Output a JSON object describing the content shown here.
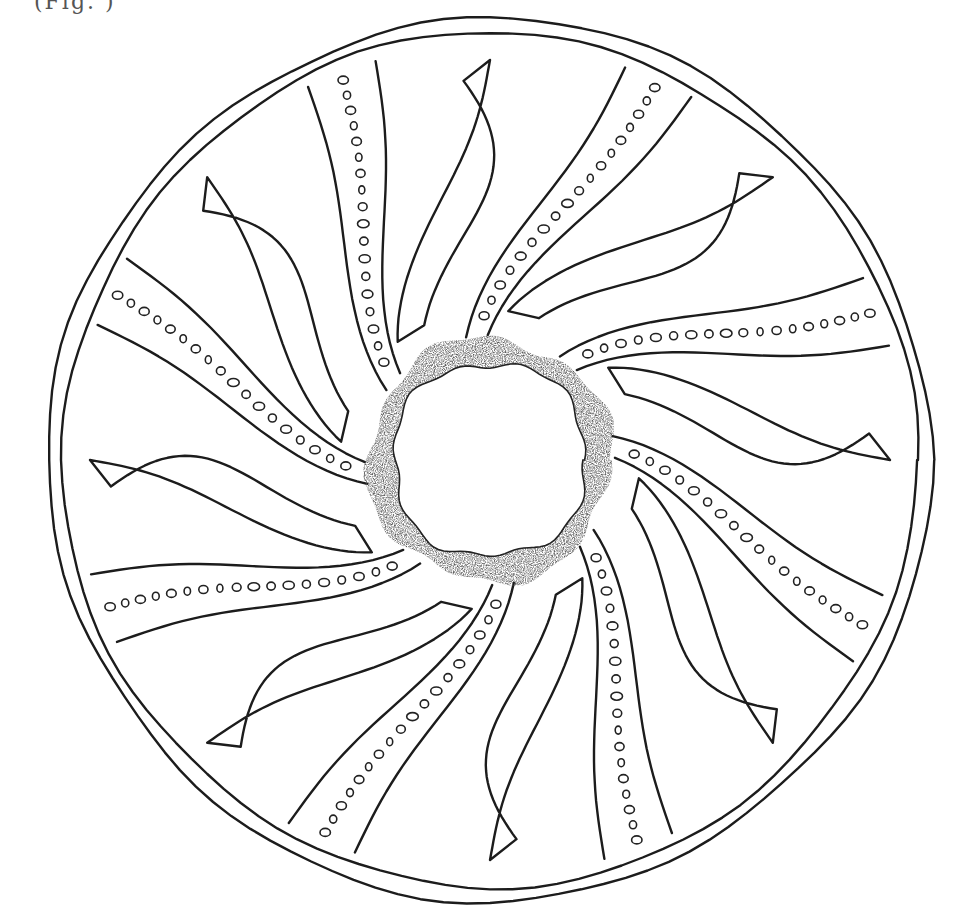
{
  "figure": {
    "caption_fragment": "(Fig. )",
    "ink_color": "#1c1c1c",
    "background": "#ffffff",
    "center": [
      490,
      460
    ],
    "outer_radius": 440,
    "ring": {
      "inner_radius": 98,
      "outer_radius": 122,
      "stipple_color": "#2a2a2a"
    },
    "lobe_count": 8,
    "lobe_angles_deg": [
      -95,
      -50,
      -5,
      40,
      85,
      130,
      175,
      220
    ]
  }
}
